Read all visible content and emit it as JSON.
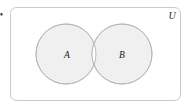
{
  "figure": {
    "kind": "venn-diagram",
    "width": 192,
    "height": 111,
    "background_color": "#ffffff"
  },
  "universe": {
    "label": "U",
    "label_x": 172,
    "label_y": 17,
    "box": {
      "x": 10.5,
      "y": 7.5,
      "width": 170,
      "height": 93,
      "corner_radius": 6,
      "stroke_color": "#c9c9c9",
      "stroke_width": 1,
      "fill_color": "#ffffff"
    }
  },
  "sets": [
    {
      "label": "A",
      "cx": 66,
      "cy": 54,
      "r": 30,
      "fill_color": "#f0f0f0",
      "stroke_color": "#b5b5b5",
      "stroke_width": 0.9,
      "label_x": 67,
      "label_y": 56
    },
    {
      "label": "B",
      "cx": 122,
      "cy": 54,
      "r": 30,
      "fill_color": "#f0f0f0",
      "stroke_color": "#b5b5b5",
      "stroke_width": 0.9,
      "label_x": 122,
      "label_y": 56
    }
  ],
  "intersection": {
    "fill_color": "#ffffff",
    "description": "lens-shaped overlap region rendered unfilled (white)"
  },
  "edge_artifact": {
    "x": 1,
    "y": 14,
    "size": 2,
    "color": "#3a3a3a"
  }
}
